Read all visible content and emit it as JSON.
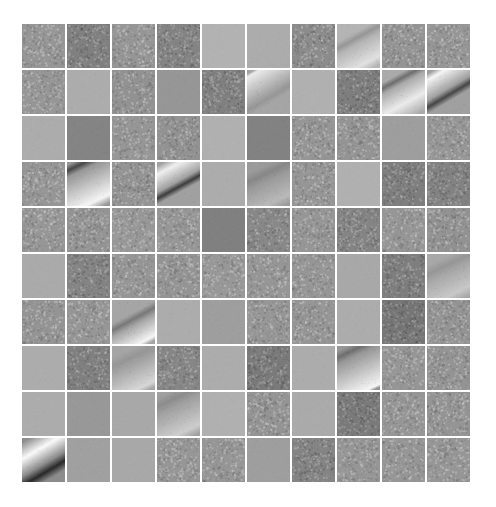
{
  "figure": {
    "rows": 10,
    "cols": 10,
    "tiles": [
      [
        {
          "type": "noise",
          "tone": 150
        },
        {
          "type": "noise",
          "tone": 128
        },
        {
          "type": "noise",
          "tone": 150
        },
        {
          "type": "noise",
          "tone": 132
        },
        {
          "type": "smooth",
          "tone": 178
        },
        {
          "type": "smooth",
          "tone": 172
        },
        {
          "type": "noise",
          "tone": 140
        },
        {
          "type": "stripe",
          "tone": 180,
          "band": 150,
          "light": 225,
          "angle": 28,
          "pos": 0.35,
          "width": 0.22,
          "lightPos": 0.85
        },
        {
          "type": "noise",
          "tone": 148
        },
        {
          "type": "noise",
          "tone": 150
        }
      ],
      [
        {
          "type": "noise",
          "tone": 150
        },
        {
          "type": "smooth",
          "tone": 172
        },
        {
          "type": "noise",
          "tone": 146
        },
        {
          "type": "smooth",
          "tone": 150
        },
        {
          "type": "noise",
          "tone": 128
        },
        {
          "type": "stripe",
          "tone": 165,
          "band": 150,
          "light": 235,
          "angle": 30,
          "pos": 0.6,
          "width": 0.2,
          "lightPos": 0.05
        },
        {
          "type": "smooth",
          "tone": 176
        },
        {
          "type": "noise",
          "tone": 126
        },
        {
          "type": "stripe",
          "tone": 170,
          "band": 110,
          "light": 235,
          "angle": 28,
          "pos": 0.25,
          "width": 0.2,
          "lightPos": 0.7
        },
        {
          "type": "stripe",
          "tone": 160,
          "band": 70,
          "light": 245,
          "angle": 30,
          "pos": 0.55,
          "width": 0.22,
          "lightPos": 0.1
        }
      ],
      [
        {
          "type": "smooth",
          "tone": 172
        },
        {
          "type": "smooth",
          "tone": 132
        },
        {
          "type": "noise",
          "tone": 150
        },
        {
          "type": "noise",
          "tone": 146
        },
        {
          "type": "smooth",
          "tone": 176
        },
        {
          "type": "smooth",
          "tone": 130
        },
        {
          "type": "noise",
          "tone": 150
        },
        {
          "type": "noise",
          "tone": 148
        },
        {
          "type": "smooth",
          "tone": 158
        },
        {
          "type": "noise",
          "tone": 150
        }
      ],
      [
        {
          "type": "noise",
          "tone": 150
        },
        {
          "type": "stripe",
          "tone": 150,
          "band": 70,
          "light": 245,
          "angle": 25,
          "pos": 0.1,
          "width": 0.22,
          "lightPos": 0.85
        },
        {
          "type": "noise",
          "tone": 148
        },
        {
          "type": "stripe",
          "tone": 160,
          "band": 60,
          "light": 240,
          "angle": 28,
          "pos": 0.55,
          "width": 0.2,
          "lightPos": 0.15
        },
        {
          "type": "smooth",
          "tone": 172
        },
        {
          "type": "stripe",
          "tone": 155,
          "band": 135,
          "light": 185,
          "angle": 25,
          "pos": 0.3,
          "width": 0.3,
          "lightPos": 0.85
        },
        {
          "type": "noise",
          "tone": 150
        },
        {
          "type": "smooth",
          "tone": 176
        },
        {
          "type": "noise",
          "tone": 126
        },
        {
          "type": "noise",
          "tone": 130
        }
      ],
      [
        {
          "type": "noise",
          "tone": 150
        },
        {
          "type": "noise",
          "tone": 148
        },
        {
          "type": "noise",
          "tone": 152
        },
        {
          "type": "noise",
          "tone": 150
        },
        {
          "type": "smooth",
          "tone": 128
        },
        {
          "type": "noise",
          "tone": 136
        },
        {
          "type": "noise",
          "tone": 150
        },
        {
          "type": "noise",
          "tone": 132
        },
        {
          "type": "noise",
          "tone": 150
        },
        {
          "type": "noise",
          "tone": 146
        }
      ],
      [
        {
          "type": "smooth",
          "tone": 170
        },
        {
          "type": "noise",
          "tone": 132
        },
        {
          "type": "noise",
          "tone": 150
        },
        {
          "type": "noise",
          "tone": 148
        },
        {
          "type": "noise",
          "tone": 152
        },
        {
          "type": "noise",
          "tone": 150
        },
        {
          "type": "noise",
          "tone": 150
        },
        {
          "type": "smooth",
          "tone": 168
        },
        {
          "type": "noise",
          "tone": 126
        },
        {
          "type": "stripe",
          "tone": 168,
          "band": 150,
          "light": 200,
          "angle": 25,
          "pos": 0.3,
          "width": 0.3,
          "lightPos": 0.85
        }
      ],
      [
        {
          "type": "noise",
          "tone": 148
        },
        {
          "type": "noise",
          "tone": 150
        },
        {
          "type": "stripe",
          "tone": 165,
          "band": 120,
          "light": 245,
          "angle": 28,
          "pos": 0.45,
          "width": 0.22,
          "lightPos": 0.92
        },
        {
          "type": "smooth",
          "tone": 172
        },
        {
          "type": "smooth",
          "tone": 158
        },
        {
          "type": "noise",
          "tone": 150
        },
        {
          "type": "noise",
          "tone": 150
        },
        {
          "type": "smooth",
          "tone": 172
        },
        {
          "type": "noise",
          "tone": 118
        },
        {
          "type": "noise",
          "tone": 148
        }
      ],
      [
        {
          "type": "smooth",
          "tone": 172
        },
        {
          "type": "noise",
          "tone": 128
        },
        {
          "type": "stripe",
          "tone": 165,
          "band": 150,
          "light": 215,
          "angle": 25,
          "pos": 0.3,
          "width": 0.3,
          "lightPos": 0.9
        },
        {
          "type": "noise",
          "tone": 134
        },
        {
          "type": "smooth",
          "tone": 172
        },
        {
          "type": "noise",
          "tone": 122
        },
        {
          "type": "smooth",
          "tone": 172
        },
        {
          "type": "stripe",
          "tone": 150,
          "band": 110,
          "light": 245,
          "angle": 25,
          "pos": 0.15,
          "width": 0.22,
          "lightPos": 0.95
        },
        {
          "type": "noise",
          "tone": 150
        },
        {
          "type": "noise",
          "tone": 148
        }
      ],
      [
        {
          "type": "smooth",
          "tone": 172
        },
        {
          "type": "smooth",
          "tone": 152
        },
        {
          "type": "smooth",
          "tone": 168
        },
        {
          "type": "stripe",
          "tone": 160,
          "band": 140,
          "light": 205,
          "angle": 25,
          "pos": 0.2,
          "width": 0.3,
          "lightPos": 0.85
        },
        {
          "type": "smooth",
          "tone": 176
        },
        {
          "type": "noise",
          "tone": 148
        },
        {
          "type": "smooth",
          "tone": 170
        },
        {
          "type": "noise",
          "tone": 122
        },
        {
          "type": "noise",
          "tone": 150
        },
        {
          "type": "noise",
          "tone": 148
        }
      ],
      [
        {
          "type": "stripe",
          "tone": 140,
          "band": 40,
          "light": 250,
          "angle": 30,
          "pos": 0.72,
          "width": 0.3,
          "lightPos": 0.28
        },
        {
          "type": "smooth",
          "tone": 160
        },
        {
          "type": "smooth",
          "tone": 168
        },
        {
          "type": "noise",
          "tone": 150
        },
        {
          "type": "noise",
          "tone": 150
        },
        {
          "type": "smooth",
          "tone": 158
        },
        {
          "type": "noise",
          "tone": 132
        },
        {
          "type": "noise",
          "tone": 150
        },
        {
          "type": "noise",
          "tone": 150
        },
        {
          "type": "noise",
          "tone": 150
        }
      ]
    ]
  }
}
